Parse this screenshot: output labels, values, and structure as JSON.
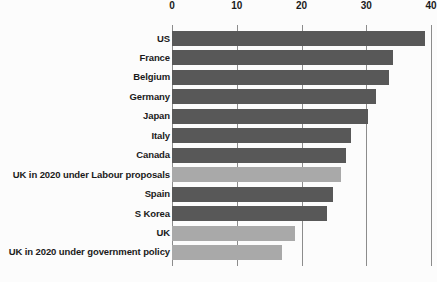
{
  "chart_data": {
    "type": "bar",
    "orientation": "horizontal",
    "title": "",
    "subtitle": "",
    "xlabel": "",
    "ylabel": "",
    "xlim": [
      0,
      40
    ],
    "xticks": [
      0,
      10,
      20,
      30,
      40
    ],
    "xtick_labels": [
      "0",
      "10",
      "20",
      "30",
      "40"
    ],
    "grid": true,
    "grid_axis": "x",
    "legend": false,
    "legend_position": "none",
    "categories": [
      "US",
      "France",
      "Belgium",
      "Germany",
      "Japan",
      "Italy",
      "Canada",
      "UK in 2020 under Labour proposals",
      "Spain",
      "S Korea",
      "UK",
      "UK in 2020 under government policy"
    ],
    "values": [
      39.0,
      34.2,
      33.5,
      31.5,
      30.3,
      27.6,
      26.8,
      26.1,
      24.8,
      24.0,
      19.0,
      17.0
    ],
    "bar_styles": [
      "dark",
      "dark",
      "dark",
      "dark",
      "dark",
      "dark",
      "dark",
      "light",
      "dark",
      "dark",
      "light",
      "light"
    ],
    "colors": {
      "bar_dark": "#585858",
      "bar_light": "#a9a9a9",
      "gridline": "#8c8c8c",
      "text": "#1a1a1a",
      "background": "#fcfcfc"
    }
  }
}
